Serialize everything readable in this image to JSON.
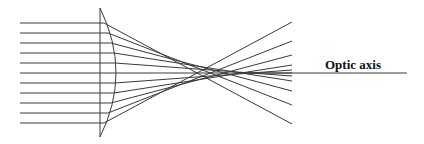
{
  "diagram": {
    "axis_label": "Optic axis",
    "colors": {
      "line": "#3a3a3a",
      "text": "#111111",
      "background": "#ffffff"
    },
    "lens": {
      "flat_x": 100,
      "top_y": 8,
      "bottom_y": 137,
      "bulge_x": 116,
      "center_y": 73
    },
    "optic_axis": {
      "x1": 236,
      "x2": 407,
      "y": 73
    },
    "label_pos": {
      "x": 325,
      "y": 69
    },
    "rays": [
      {
        "y": 23,
        "exit_x": 104,
        "end_x": 292,
        "end_y": 124
      },
      {
        "y": 33,
        "exit_x": 108,
        "end_x": 292,
        "end_y": 105
      },
      {
        "y": 43,
        "exit_x": 111,
        "end_x": 292,
        "end_y": 91
      },
      {
        "y": 53,
        "exit_x": 114,
        "end_x": 292,
        "end_y": 81
      },
      {
        "y": 63,
        "exit_x": 115,
        "end_x": 292,
        "end_y": 76
      },
      {
        "y": 73,
        "exit_x": 116,
        "end_x": 292,
        "end_y": 73
      },
      {
        "y": 83,
        "exit_x": 115,
        "end_x": 292,
        "end_y": 70
      },
      {
        "y": 93,
        "exit_x": 114,
        "end_x": 292,
        "end_y": 65
      },
      {
        "y": 103,
        "exit_x": 111,
        "end_x": 292,
        "end_y": 55
      },
      {
        "y": 113,
        "exit_x": 108,
        "end_x": 292,
        "end_y": 41
      },
      {
        "y": 123,
        "exit_x": 104,
        "end_x": 292,
        "end_y": 22
      }
    ],
    "ray_start_x": 20
  }
}
